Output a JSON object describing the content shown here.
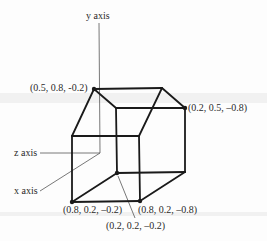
{
  "diagram": {
    "title": "",
    "axes": {
      "y": {
        "label": "y axis"
      },
      "z": {
        "label": "z axis"
      },
      "x": {
        "label": "x axis"
      }
    },
    "vertex_labels": {
      "top_left": "(0.5, 0.8, -0.2)",
      "top_right": "(0.2, 0.5, –0.8)",
      "bottom_left": "(0.8, 0.2, –0.2)",
      "bottom_right": "(0.8, 0.2, –0.8)",
      "back_bottom": "(0.2, 0.2, –0.2)"
    },
    "colors": {
      "edge": "#1a1a1a",
      "axis": "#555555",
      "text": "#2a2a2a"
    }
  }
}
